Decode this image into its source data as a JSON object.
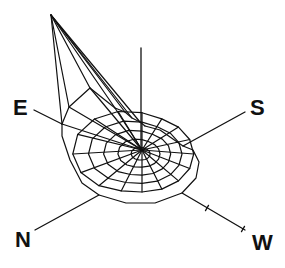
{
  "diagram": {
    "type": "3d-wireframe-polar-rose",
    "stroke_color": "#111111",
    "background": "#ffffff",
    "center": [
      142,
      150
    ],
    "vertical_axis": {
      "top": [
        141,
        48
      ],
      "bottom": [
        141,
        150
      ]
    },
    "apex": [
      51,
      15
    ],
    "axes": [
      {
        "id": "E",
        "label": "E",
        "from": [
          34,
          110
        ],
        "to": [
          62,
          124
        ],
        "label_pos": [
          13,
          97
        ]
      },
      {
        "id": "S",
        "label": "S",
        "from": [
          183,
          146
        ],
        "to": [
          245,
          112
        ],
        "label_pos": [
          250,
          97
        ]
      },
      {
        "id": "N",
        "label": "N",
        "from": [
          35,
          230
        ],
        "to": [
          99,
          195
        ],
        "label_pos": [
          15,
          229
        ]
      },
      {
        "id": "W",
        "label": "W",
        "from": [
          182,
          193
        ],
        "to": [
          245,
          230
        ],
        "label_pos": [
          252,
          232
        ],
        "ticks": [
          [
            207,
            208
          ],
          [
            243,
            229
          ]
        ]
      }
    ]
  }
}
